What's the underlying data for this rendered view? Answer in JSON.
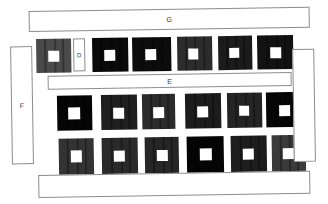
{
  "figure": {
    "title_visible": false,
    "background_color": "#ffffff",
    "outline_color": "#8d8d8d",
    "label_color": "#3b3b3b",
    "rotation_degrees": -0.9
  },
  "labeled_regions": [
    {
      "id": "region-g",
      "label": "G",
      "shape": "horizontal-bar",
      "x": 30,
      "y": 9,
      "w": 281,
      "h": 21,
      "label_visible": true
    },
    {
      "id": "region-d",
      "label": "D",
      "shape": "vertical-bar",
      "x": 74,
      "y": 37,
      "w": 12,
      "h": 33,
      "label_visible": true
    },
    {
      "id": "region-e",
      "label": "E",
      "shape": "horizontal-bar",
      "x": 48,
      "y": 74,
      "w": 244,
      "h": 14,
      "label_visible": true
    },
    {
      "id": "region-f",
      "label": "F",
      "shape": "vertical-bar",
      "x": 11,
      "y": 44,
      "w": 22,
      "h": 118,
      "label_visible": true
    },
    {
      "id": "region-right-bar",
      "label": "",
      "shape": "vertical-bar",
      "x": 293,
      "y": 51,
      "w": 22,
      "h": 113,
      "label_visible": false
    },
    {
      "id": "region-bottom-bar",
      "label": "",
      "shape": "horizontal-bar",
      "x": 37,
      "y": 173,
      "w": 272,
      "h": 23,
      "label_visible": false
    }
  ],
  "block_rows": [
    {
      "id": "row-top",
      "y": 37,
      "height": 34,
      "blocks": [
        {
          "x": 37,
          "w": 35,
          "fill": "#4a4a4a",
          "hole_x_offset": 12,
          "hole_w": 11,
          "hole_h": 11,
          "stripes": [
            8,
            18,
            26
          ]
        },
        {
          "x": 93,
          "w": 36,
          "fill": "#0a0a0a",
          "hole_x_offset": 12,
          "hole_w": 11,
          "hole_h": 11,
          "stripes": [
            8,
            18,
            27
          ]
        },
        {
          "x": 133,
          "w": 39,
          "fill": "#0c0c0c",
          "hole_x_offset": 13,
          "hole_w": 11,
          "hole_h": 11,
          "stripes": [
            9,
            20,
            29
          ]
        },
        {
          "x": 178,
          "w": 35,
          "fill": "#2c2c2c",
          "hole_x_offset": 11,
          "hole_w": 10,
          "hole_h": 11,
          "stripes": [
            8,
            17,
            26
          ]
        },
        {
          "x": 219,
          "w": 34,
          "fill": "#1b1b1b",
          "hole_x_offset": 11,
          "hole_w": 10,
          "hole_h": 10,
          "stripes": [
            8,
            17,
            25
          ]
        },
        {
          "x": 258,
          "w": 36,
          "fill": "#121212",
          "hole_x_offset": 13,
          "hole_w": 11,
          "hole_h": 11,
          "stripes": [
            9,
            19,
            27
          ]
        }
      ]
    },
    {
      "id": "row-middle",
      "y": 94,
      "height": 36,
      "blocks": [
        {
          "x": 57,
          "w": 35,
          "fill": "#050505",
          "hole_x_offset": 11,
          "hole_w": 12,
          "hole_h": 12,
          "stripes": [
            8,
            18,
            26
          ]
        },
        {
          "x": 101,
          "w": 36,
          "fill": "#1f1f1f",
          "hole_x_offset": 12,
          "hole_w": 11,
          "hole_h": 11,
          "stripes": [
            9,
            19,
            27
          ]
        },
        {
          "x": 142,
          "w": 33,
          "fill": "#2b2b2b",
          "hole_x_offset": 11,
          "hole_w": 11,
          "hole_h": 11,
          "stripes": [
            8,
            17,
            25
          ]
        },
        {
          "x": 185,
          "w": 36,
          "fill": "#1c1c1c",
          "hole_x_offset": 12,
          "hole_w": 11,
          "hole_h": 11,
          "stripes": [
            9,
            19,
            27
          ]
        },
        {
          "x": 227,
          "w": 35,
          "fill": "#242424",
          "hole_x_offset": 12,
          "hole_w": 10,
          "hole_h": 10,
          "stripes": [
            8,
            18,
            26
          ]
        },
        {
          "x": 266,
          "w": 36,
          "fill": "#060606",
          "hole_x_offset": 13,
          "hole_w": 11,
          "hole_h": 11,
          "stripes": [
            9,
            19,
            28
          ]
        }
      ]
    },
    {
      "id": "row-bottom",
      "y": 136,
      "height": 38,
      "blocks": [
        {
          "x": 58,
          "w": 35,
          "fill": "#333333",
          "hole_x_offset": 12,
          "hole_w": 11,
          "hole_h": 12,
          "stripes": [
            8,
            18,
            26
          ]
        },
        {
          "x": 101,
          "w": 36,
          "fill": "#2a2a2a",
          "hole_x_offset": 12,
          "hole_w": 11,
          "hole_h": 11,
          "stripes": [
            9,
            19,
            27
          ]
        },
        {
          "x": 144,
          "w": 34,
          "fill": "#262626",
          "hole_x_offset": 12,
          "hole_w": 11,
          "hole_h": 11,
          "stripes": [
            8,
            18,
            26
          ]
        },
        {
          "x": 186,
          "w": 37,
          "fill": "#050505",
          "hole_x_offset": 13,
          "hole_w": 12,
          "hole_h": 12,
          "stripes": [
            9,
            20,
            28
          ]
        },
        {
          "x": 230,
          "w": 36,
          "fill": "#1d1d1d",
          "hole_x_offset": 12,
          "hole_w": 11,
          "hole_h": 11,
          "stripes": [
            9,
            19,
            27
          ]
        },
        {
          "x": 271,
          "w": 34,
          "fill": "#3a3a3a",
          "hole_x_offset": 11,
          "hole_w": 11,
          "hole_h": 11,
          "stripes": [
            8,
            17,
            25
          ]
        }
      ]
    }
  ],
  "gap_bars": [
    {
      "id": "gap-middle-bottom",
      "x": 57,
      "y": 129,
      "w": 248,
      "h": 8
    }
  ]
}
